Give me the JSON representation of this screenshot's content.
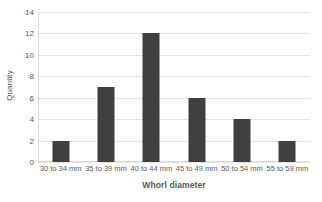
{
  "chart_data": {
    "type": "bar",
    "title": "",
    "subtitle": "",
    "xlabel": "Whorl diameter",
    "ylabel": "Quantity",
    "categories": [
      "30 to 34 mm",
      "35 to 39 mm",
      "40 to 44 mm",
      "45 to 49 mm",
      "50 to 54 mm",
      "55 to 59 mm"
    ],
    "values": [
      2,
      7,
      12,
      6,
      4,
      2
    ],
    "ylim": [
      0,
      14
    ],
    "ytick_step": 2,
    "yticks": [
      0,
      2,
      4,
      6,
      8,
      10,
      12,
      14
    ],
    "ytick_labels": [
      "0",
      "2",
      "4",
      "6",
      "8",
      "10",
      "12",
      "14"
    ],
    "grid": "horizontal",
    "legend": "none",
    "annotations": [],
    "colors": {
      "bar": "#404040",
      "gridline": "#e6e6e6",
      "axis_line": "#d9d9d9",
      "text": "#595959",
      "background": "#ffffff"
    }
  }
}
